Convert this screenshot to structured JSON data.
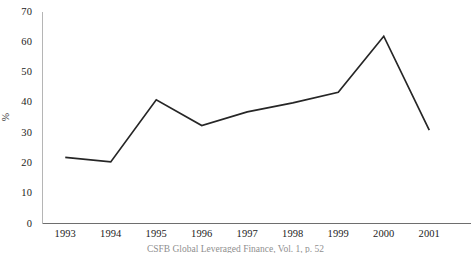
{
  "chart_data": {
    "type": "line",
    "title": "",
    "subtitle": "",
    "xlabel": "",
    "ylabel": "%",
    "categories": [
      "1993",
      "1994",
      "1995",
      "1996",
      "1997",
      "1998",
      "1999",
      "2000",
      "2001"
    ],
    "x": [
      1993,
      1994,
      1995,
      1996,
      1997,
      1998,
      1999,
      2000,
      2001
    ],
    "values": [
      22,
      20.5,
      41,
      32.5,
      37,
      40,
      43.5,
      62,
      31
    ],
    "series": [
      {
        "name": "",
        "values": [
          22,
          20.5,
          41,
          32.5,
          37,
          40,
          43.5,
          62,
          31
        ]
      }
    ],
    "ylim": [
      0,
      70
    ],
    "ytick_values": [
      0,
      10,
      20,
      30,
      40,
      50,
      60,
      70
    ],
    "ytick_labels": [
      "0",
      "10",
      "20",
      "30",
      "40",
      "50",
      "60",
      "70"
    ],
    "grid": false,
    "legend": false,
    "legend_position": "none",
    "markers": false,
    "line_color": "#262626",
    "axis_color": "#b5b5b5",
    "annotations": []
  },
  "figure": {
    "y_axis_title": "%",
    "source_caption": "CSFB Global Leveraged Finance, Vol. 1, p. 52"
  }
}
